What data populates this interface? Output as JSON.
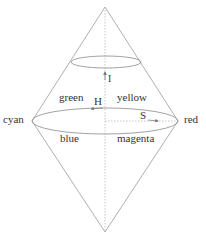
{
  "diagram": {
    "colors": {
      "line": "#9a9a9a",
      "axis": "#b0b0b0",
      "text": "#333333",
      "background": "#ffffff"
    },
    "labels": {
      "intensity": "I",
      "hue": "H",
      "saturation": "S",
      "cyan": "cyan",
      "red": "red",
      "green": "green",
      "yellow": "yellow",
      "blue": "blue",
      "magenta": "magenta"
    },
    "geometry": {
      "top_apex": [
        105,
        7
      ],
      "bottom_apex": [
        105,
        232
      ],
      "large_ellipse": {
        "cx": 105,
        "cy": 121,
        "rx": 73,
        "ry": 13
      },
      "small_ellipse": {
        "cx": 106,
        "cy": 62,
        "rx": 35,
        "ry": 6
      }
    }
  }
}
